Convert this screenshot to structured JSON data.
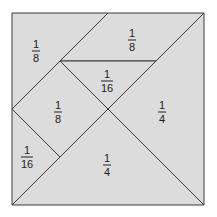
{
  "diagram": {
    "fill_color": "#dcdcdc",
    "stroke_color": "#3a3a3a",
    "pieces": [
      {
        "name": "top-left-triangle",
        "numerator": "1",
        "denominator": "8"
      },
      {
        "name": "top-right-parallelogram",
        "numerator": "1",
        "denominator": "8"
      },
      {
        "name": "center-small-triangle",
        "numerator": "1",
        "denominator": "16"
      },
      {
        "name": "left-square",
        "numerator": "1",
        "denominator": "8"
      },
      {
        "name": "right-large-triangle",
        "numerator": "1",
        "denominator": "4"
      },
      {
        "name": "bottom-left-small-triangle",
        "numerator": "1",
        "denominator": "16"
      },
      {
        "name": "bottom-large-triangle",
        "numerator": "1",
        "denominator": "4"
      }
    ]
  }
}
